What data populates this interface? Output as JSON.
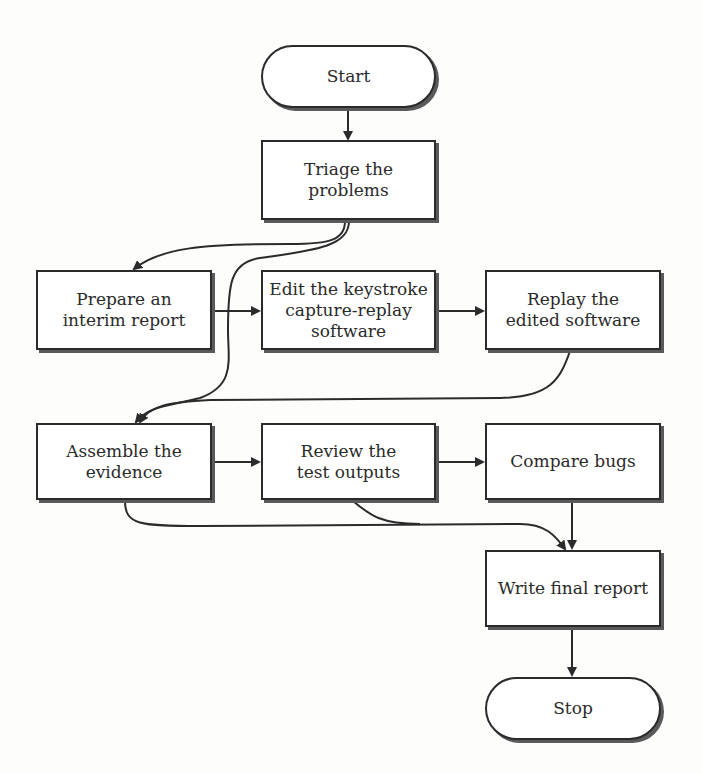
{
  "flowchart": {
    "nodes": {
      "start": {
        "label": "Start"
      },
      "triage": {
        "label": "Triage the\nproblems"
      },
      "prepare": {
        "label": "Prepare an\ninterim report"
      },
      "edit": {
        "label": "Edit the keystroke\ncapture-replay\nsoftware"
      },
      "replay": {
        "label": "Replay the\nedited software"
      },
      "assemble": {
        "label": "Assemble the\nevidence"
      },
      "review": {
        "label": "Review the\ntest outputs"
      },
      "compare": {
        "label": "Compare bugs"
      },
      "write": {
        "label": "Write final report"
      },
      "stop": {
        "label": "Stop"
      }
    },
    "edges": [
      [
        "start",
        "triage"
      ],
      [
        "triage",
        "prepare"
      ],
      [
        "triage",
        "assemble"
      ],
      [
        "prepare",
        "edit"
      ],
      [
        "edit",
        "replay"
      ],
      [
        "replay",
        "assemble"
      ],
      [
        "assemble",
        "review"
      ],
      [
        "review",
        "compare"
      ],
      [
        "compare",
        "write"
      ],
      [
        "assemble",
        "write"
      ],
      [
        "review",
        "write"
      ],
      [
        "write",
        "stop"
      ]
    ],
    "colors": {
      "stroke": "#2b2b2b",
      "shadow": "#5a5a5a",
      "fill": "#ffffff"
    }
  }
}
